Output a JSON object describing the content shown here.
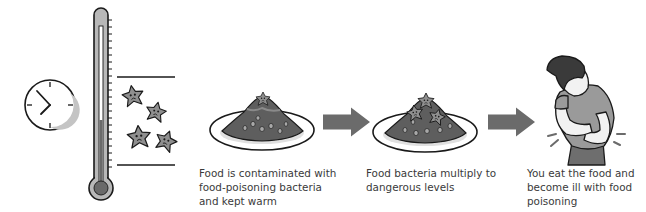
{
  "diagram": {
    "colors": {
      "background": "#ffffff",
      "outline": "#1a1a1a",
      "arrow": "#6b6b6b",
      "bacteria_fill": "#8f8f8f",
      "food_fill": "#5e5e5e",
      "mercury": "#6a6a6a",
      "tube_fill": "#b8b8b8",
      "clock_shadow": "#c4c4c4",
      "caption_text": "#3a3a3a"
    },
    "icons": {
      "clock": "clock-icon",
      "thermometer": "thermometer-icon",
      "bacteria": "bacteria-icon",
      "plate_contaminated": "food-plate-icon",
      "plate_multiplied": "food-plate-bacteria-icon",
      "arrow": "arrow-right-icon",
      "sick_person": "sick-person-icon"
    },
    "steps": [
      {
        "caption_lines": [
          "Food is contaminated with",
          "food-poisoning bacteria",
          "and kept warm"
        ]
      },
      {
        "caption_lines": [
          "Food bacteria multiply to",
          "dangerous levels"
        ]
      },
      {
        "caption_lines": [
          "You eat the food and",
          "become ill with food",
          "poisoning"
        ]
      }
    ]
  }
}
